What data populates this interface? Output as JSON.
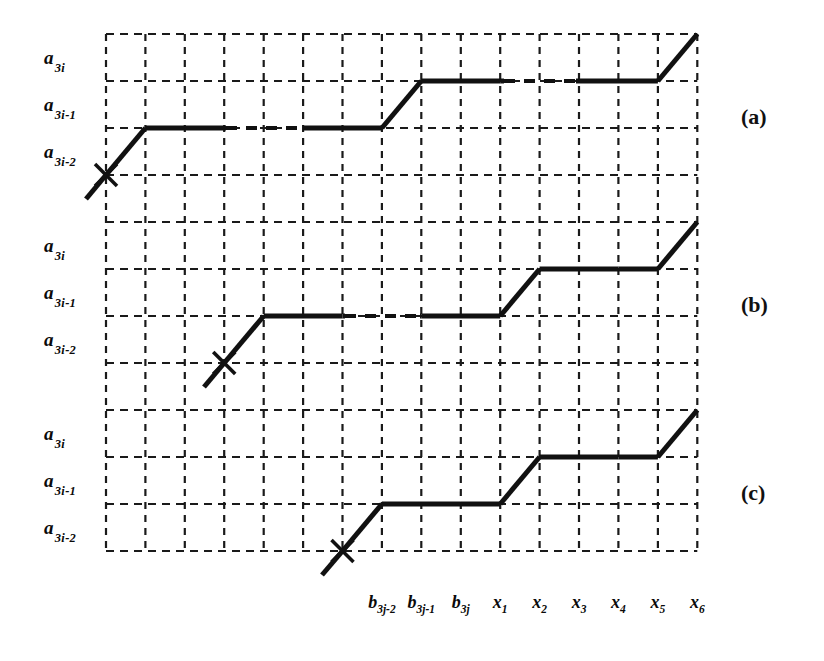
{
  "figure": {
    "kind": "staircase-monotone-path-diagram",
    "background": "#ffffff",
    "ink": "#111111",
    "grid_color": "#1a1a1a"
  },
  "axes": {
    "y_ticks": [
      {
        "base": "a",
        "sub": "3i"
      },
      {
        "base": "a",
        "sub": "3i-1"
      },
      {
        "base": "a",
        "sub": "3i-2"
      }
    ],
    "x_ticks": [
      {
        "base": "b",
        "sub": "3j-2"
      },
      {
        "base": "b",
        "sub": "3j-1"
      },
      {
        "base": "b",
        "sub": "3j"
      },
      {
        "base": "x",
        "sub": "1"
      },
      {
        "base": "x",
        "sub": "2"
      },
      {
        "base": "x",
        "sub": "3"
      },
      {
        "base": "x",
        "sub": "4"
      },
      {
        "base": "x",
        "sub": "5"
      },
      {
        "base": "x",
        "sub": "6"
      }
    ]
  },
  "panels": [
    {
      "id": "a",
      "label": "(a)"
    },
    {
      "id": "b",
      "label": "(b)"
    },
    {
      "id": "c",
      "label": "(c)"
    }
  ],
  "chart_data": {
    "type": "line",
    "title": "",
    "xlabel": "",
    "ylabel": "",
    "grid": true,
    "legend": false,
    "grid_geometry": {
      "x_lines": [
        106,
        145.4,
        184.8,
        224.2,
        263.7,
        303.1,
        342.5,
        381.9,
        421.3,
        460.8,
        500.2,
        539.6,
        579.0,
        618.4,
        657.9,
        697.3
      ],
      "y_lines": [
        34,
        81,
        128,
        175,
        222,
        269,
        316,
        363,
        410,
        457,
        504,
        551
      ],
      "columns": 15,
      "rows": 11
    },
    "x_tick_positions": [
      381.9,
      421.3,
      460.8,
      500.2,
      539.6,
      579.0,
      618.4,
      657.9,
      697.3
    ],
    "y_tick_positions": {
      "a": [
        81,
        128,
        175
      ],
      "b": [
        269,
        316,
        363
      ],
      "c": [
        457,
        504,
        551
      ]
    },
    "series": [
      {
        "name": "(a)",
        "marker": "x-cross",
        "marker_at": [
          106,
          175
        ],
        "tail_start": [
          86,
          199
        ],
        "points": [
          [
            86,
            199
          ],
          [
            106,
            175
          ],
          [
            145.4,
            128
          ],
          [
            224.2,
            128
          ],
          [
            303.1,
            128
          ],
          [
            381.9,
            128
          ],
          [
            421.3,
            81
          ],
          [
            500.2,
            81
          ],
          [
            579.0,
            81
          ],
          [
            657.9,
            81
          ],
          [
            697.3,
            34
          ]
        ],
        "elisions": [
          [
            226,
            303
          ],
          [
            504,
            576
          ]
        ]
      },
      {
        "name": "(b)",
        "marker": "x-cross",
        "marker_at": [
          224.2,
          363
        ],
        "tail_start": [
          204,
          387
        ],
        "points": [
          [
            204,
            387
          ],
          [
            224.2,
            363
          ],
          [
            263.7,
            316
          ],
          [
            342.5,
            316
          ],
          [
            421.3,
            316
          ],
          [
            500.2,
            316
          ],
          [
            539.6,
            269
          ],
          [
            618.4,
            269
          ],
          [
            657.9,
            269
          ],
          [
            697.3,
            222
          ]
        ],
        "elisions": [
          [
            345,
            420
          ]
        ]
      },
      {
        "name": "(c)",
        "marker": "x-cross",
        "marker_at": [
          342.5,
          551
        ],
        "tail_start": [
          322,
          575
        ],
        "points": [
          [
            322,
            575
          ],
          [
            342.5,
            551
          ],
          [
            381.9,
            504
          ],
          [
            460.8,
            504
          ],
          [
            500.2,
            504
          ],
          [
            539.6,
            457
          ],
          [
            618.4,
            457
          ],
          [
            657.9,
            457
          ],
          [
            697.3,
            410
          ]
        ],
        "elisions": []
      }
    ]
  }
}
